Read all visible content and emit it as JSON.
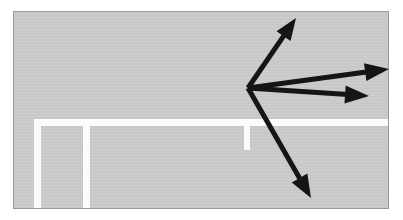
{
  "scene": {
    "kind": "traffic-camera-still-with-annotation-arrows",
    "width": 403,
    "height": 220,
    "page_background": "#ffffff"
  },
  "photo": {
    "left": 13,
    "top": 11,
    "width": 376,
    "height": 198,
    "border_color": "#9a9a9a",
    "surface_color": "#c9c9c9",
    "surface_label": "road-surface"
  },
  "road_markings": {
    "paint_color": "#fbfbfb",
    "items": [
      {
        "name": "stop-line-horizontal",
        "x": 20,
        "y": 107,
        "w": 356,
        "h": 7
      },
      {
        "name": "lane-line-vertical-left",
        "x": 20,
        "y": 114,
        "w": 7,
        "h": 84
      },
      {
        "name": "lane-line-vertical-middle",
        "x": 69,
        "y": 114,
        "w": 7,
        "h": 84
      },
      {
        "name": "lane-divider-tick",
        "x": 230,
        "y": 114,
        "w": 6,
        "h": 24
      }
    ]
  },
  "annotation": {
    "arrow_color": "#151515",
    "shaft_width": 5,
    "origin": {
      "x": 248,
      "y": 88
    },
    "arrows": [
      {
        "name": "arrow-up-right",
        "direction": "up-right",
        "from": {
          "x": 248,
          "y": 88
        },
        "to": {
          "x": 296,
          "y": 18
        },
        "head_length": 22,
        "head_width": 17
      },
      {
        "name": "arrow-right-upper",
        "direction": "right-slightly-up",
        "from": {
          "x": 248,
          "y": 88
        },
        "to": {
          "x": 389,
          "y": 69
        },
        "head_length": 24,
        "head_width": 18
      },
      {
        "name": "arrow-right-lower",
        "direction": "right-slightly-down",
        "from": {
          "x": 248,
          "y": 88
        },
        "to": {
          "x": 369,
          "y": 96
        },
        "head_length": 24,
        "head_width": 18
      },
      {
        "name": "arrow-down-right",
        "direction": "down-right",
        "from": {
          "x": 248,
          "y": 88
        },
        "to": {
          "x": 311,
          "y": 198
        },
        "head_length": 23,
        "head_width": 18
      }
    ]
  }
}
